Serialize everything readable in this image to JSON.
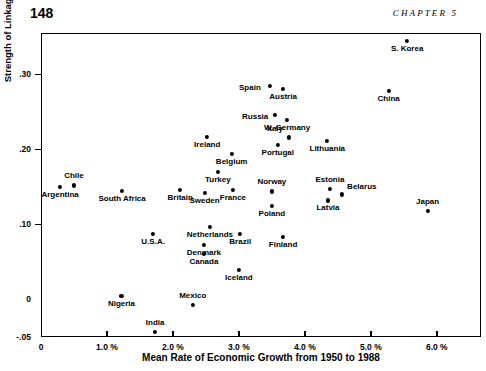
{
  "page": {
    "number": "148",
    "chapter": "CHAPTER 5"
  },
  "chart_data": {
    "type": "scatter",
    "title": "",
    "xlabel": "Mean Rate of Economic Growth from 1950 to 1988",
    "ylabel": "Strength of Linkage between Age and Values (gamma)",
    "xlim": [
      0,
      6.67
    ],
    "ylim": [
      -0.05,
      0.355
    ],
    "grid": false,
    "legend": null,
    "xticks": [
      {
        "value": 0,
        "label": "0"
      },
      {
        "value": 1.0,
        "label": "1.0 %"
      },
      {
        "value": 2.0,
        "label": "2.0 %"
      },
      {
        "value": 3.0,
        "label": "3.0 %"
      },
      {
        "value": 4.0,
        "label": "4.0 %"
      },
      {
        "value": 5.0,
        "label": "5.0 %"
      },
      {
        "value": 6.0,
        "label": "6.0 %"
      }
    ],
    "yticks": [
      {
        "value": 0.3,
        "label": ".30"
      },
      {
        "value": 0.2,
        "label": ".20"
      },
      {
        "value": 0.1,
        "label": ".10"
      },
      {
        "value": 0.0,
        "label": "0"
      },
      {
        "value": -0.05,
        "label": "-.05"
      }
    ],
    "points": [
      {
        "name": "S. Korea",
        "x": 5.55,
        "y": 0.345,
        "label_pos": "below"
      },
      {
        "name": "China",
        "x": 5.27,
        "y": 0.278,
        "label_pos": "below"
      },
      {
        "name": "Spain",
        "x": 3.47,
        "y": 0.285,
        "label_pos": "left"
      },
      {
        "name": "Austria",
        "x": 3.67,
        "y": 0.28,
        "label_pos": "below"
      },
      {
        "name": "Russia",
        "x": 3.55,
        "y": 0.246,
        "label_pos": "left"
      },
      {
        "name": "W. Germany",
        "x": 3.73,
        "y": 0.239,
        "label_pos": "below"
      },
      {
        "name": "Italy",
        "x": 3.76,
        "y": 0.216,
        "label_pos": "left-below"
      },
      {
        "name": "Lithuania",
        "x": 4.34,
        "y": 0.211,
        "label_pos": "below"
      },
      {
        "name": "Portugal",
        "x": 3.59,
        "y": 0.206,
        "label_pos": "below"
      },
      {
        "name": "Ireland",
        "x": 2.52,
        "y": 0.217,
        "label_pos": "below"
      },
      {
        "name": "Belgium",
        "x": 2.89,
        "y": 0.194,
        "label_pos": "below"
      },
      {
        "name": "Turkey",
        "x": 2.68,
        "y": 0.17,
        "label_pos": "below"
      },
      {
        "name": "Norway",
        "x": 3.5,
        "y": 0.144,
        "label_pos": "above"
      },
      {
        "name": "Poland",
        "x": 3.5,
        "y": 0.125,
        "label_pos": "below"
      },
      {
        "name": "Estonia",
        "x": 4.38,
        "y": 0.147,
        "label_pos": "above"
      },
      {
        "name": "Belarus",
        "x": 4.56,
        "y": 0.14,
        "label_pos": "right-above"
      },
      {
        "name": "Latvia",
        "x": 4.35,
        "y": 0.132,
        "label_pos": "below"
      },
      {
        "name": "Britain",
        "x": 2.11,
        "y": 0.146,
        "label_pos": "below"
      },
      {
        "name": "Sweden",
        "x": 2.48,
        "y": 0.142,
        "label_pos": "below"
      },
      {
        "name": "France",
        "x": 2.91,
        "y": 0.146,
        "label_pos": "below"
      },
      {
        "name": "Chile",
        "x": 0.5,
        "y": 0.152,
        "label_pos": "above"
      },
      {
        "name": "Argentina",
        "x": 0.29,
        "y": 0.15,
        "label_pos": "below"
      },
      {
        "name": "South Africa",
        "x": 1.23,
        "y": 0.145,
        "label_pos": "below"
      },
      {
        "name": "Japan",
        "x": 5.86,
        "y": 0.118,
        "label_pos": "above"
      },
      {
        "name": "Netherlands",
        "x": 2.56,
        "y": 0.097,
        "label_pos": "below"
      },
      {
        "name": "Denmark",
        "x": 2.47,
        "y": 0.073,
        "label_pos": "below"
      },
      {
        "name": "Canada",
        "x": 2.47,
        "y": 0.061,
        "label_pos": "below"
      },
      {
        "name": "Brazil",
        "x": 3.02,
        "y": 0.087,
        "label_pos": "below"
      },
      {
        "name": "Finland",
        "x": 3.67,
        "y": 0.083,
        "label_pos": "below"
      },
      {
        "name": "U.S.A.",
        "x": 1.7,
        "y": 0.087,
        "label_pos": "below"
      },
      {
        "name": "Iceland",
        "x": 3.0,
        "y": 0.039,
        "label_pos": "below"
      },
      {
        "name": "Nigeria",
        "x": 1.22,
        "y": 0.005,
        "label_pos": "below"
      },
      {
        "name": "Mexico",
        "x": 2.3,
        "y": -0.007,
        "label_pos": "above"
      },
      {
        "name": "India",
        "x": 1.73,
        "y": -0.043,
        "label_pos": "above"
      }
    ]
  }
}
